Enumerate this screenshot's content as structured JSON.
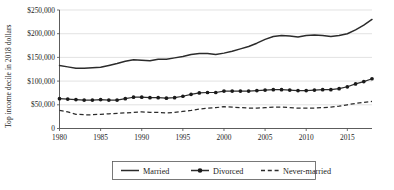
{
  "chart_data": {
    "type": "line",
    "title": "",
    "xlabel": "",
    "ylabel": "Top income decile in 2018 dollars",
    "xlim": [
      1980,
      2018
    ],
    "ylim": [
      0,
      250000
    ],
    "grid": true,
    "legend_position": "bottom-center",
    "x_ticks": [
      "1980",
      "1985",
      "1990",
      "1995",
      "2000",
      "2005",
      "2010",
      "2015"
    ],
    "x_tick_values": [
      1980,
      1985,
      1990,
      1995,
      2000,
      2005,
      2010,
      2015
    ],
    "y_ticks": [
      "0",
      "$50,000",
      "$100,000",
      "$150,000",
      "$200,000",
      "$250,000"
    ],
    "y_tick_values": [
      0,
      50000,
      100000,
      150000,
      200000,
      250000
    ],
    "x": [
      1980,
      1981,
      1982,
      1983,
      1984,
      1985,
      1986,
      1987,
      1988,
      1989,
      1990,
      1991,
      1992,
      1993,
      1994,
      1995,
      1996,
      1997,
      1998,
      1999,
      2000,
      2001,
      2002,
      2003,
      2004,
      2005,
      2006,
      2007,
      2008,
      2009,
      2010,
      2011,
      2012,
      2013,
      2014,
      2015,
      2016,
      2017,
      2018
    ],
    "series": [
      {
        "name": "Married",
        "style": "solid",
        "marker": "none",
        "color": "#2b2b2b",
        "values": [
          133000,
          130000,
          127000,
          127000,
          128000,
          129000,
          133000,
          137000,
          142000,
          145000,
          144000,
          143000,
          146000,
          146000,
          149000,
          152000,
          156000,
          158000,
          158000,
          156000,
          159000,
          163000,
          168000,
          173000,
          180000,
          188000,
          194000,
          196000,
          195000,
          193000,
          196000,
          197000,
          196000,
          194000,
          196000,
          200000,
          208000,
          218000,
          230000
        ]
      },
      {
        "name": "Divorced",
        "style": "solid",
        "marker": "circle",
        "color": "#1a1a1a",
        "values": [
          63000,
          62000,
          61000,
          60000,
          60000,
          61000,
          60000,
          60000,
          63000,
          66000,
          66000,
          65000,
          65000,
          64000,
          65000,
          68000,
          72000,
          75000,
          76000,
          76000,
          79000,
          79000,
          79000,
          79000,
          80000,
          81000,
          82000,
          82000,
          81000,
          80000,
          80000,
          81000,
          82000,
          82000,
          84000,
          88000,
          94000,
          99000,
          105000
        ]
      },
      {
        "name": "Never-married",
        "style": "dashed",
        "marker": "none",
        "color": "#2b2b2b",
        "values": [
          38000,
          35000,
          30000,
          29000,
          29000,
          30000,
          31000,
          32000,
          33000,
          34000,
          35000,
          34000,
          34000,
          33000,
          34000,
          36000,
          38000,
          41000,
          43000,
          44000,
          46000,
          45000,
          44000,
          43000,
          43000,
          44000,
          45000,
          45000,
          44000,
          43000,
          43000,
          43000,
          44000,
          45000,
          47000,
          50000,
          53000,
          55000,
          57000
        ]
      }
    ],
    "legend": [
      {
        "label": "Married",
        "style": "solid",
        "marker": "none"
      },
      {
        "label": "Divorced",
        "style": "solid",
        "marker": "circle"
      },
      {
        "label": "Never-married",
        "style": "dashed",
        "marker": "none"
      }
    ]
  }
}
